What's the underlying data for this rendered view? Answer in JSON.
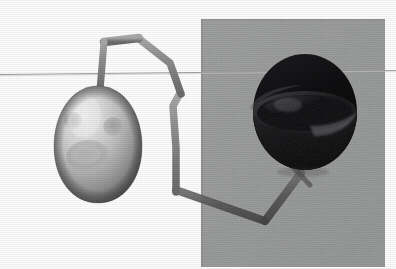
{
  "scene": {
    "title": "3D rendered scene: egg object and dark bowl linked by jointed arm",
    "width": 396,
    "height": 269,
    "background_color": "#fefefe"
  },
  "backdrop_panel": {
    "name": "gray-backdrop-panel",
    "color": "#999a9a",
    "edge_color": "#8e8f8f",
    "x": 201,
    "y": 19,
    "width": 184,
    "height": 248
  },
  "horizon_line": {
    "name": "horizon-line",
    "color": "#9b9b9b",
    "x1": 0,
    "y1": 74,
    "x2": 396,
    "y2": 70,
    "thickness": 1
  },
  "egg_object": {
    "name": "egg-object",
    "center_x": 98,
    "center_y": 145,
    "radius_x": 44,
    "radius_y": 58,
    "base_color": "#b9b9b9",
    "highlight_color": "#ececec",
    "shadow_color": "#6e6e6e",
    "spots": [
      {
        "name": "egg-spot-upper-left",
        "cx": 73,
        "cy": 121,
        "rx": 9,
        "ry": 9,
        "color": "#9a9a9a"
      },
      {
        "name": "egg-spot-upper-right",
        "cx": 113,
        "cy": 127,
        "rx": 10,
        "ry": 10,
        "color": "#969696"
      },
      {
        "name": "egg-spot-large-lower",
        "cx": 88,
        "cy": 156,
        "rx": 22,
        "ry": 16,
        "color": "#a5a5a5"
      }
    ]
  },
  "bowl_object": {
    "name": "bowl-object",
    "center_x": 305,
    "center_y": 128,
    "radius_x": 52,
    "radius_y": 42,
    "body_color": "#141414",
    "interior_color": "#0c0c0c",
    "rim_highlight_color": "#56565a",
    "inner_sheen_color": "#3e3e42"
  },
  "arm_linkage": {
    "name": "arm-linkage",
    "color": "#8a8a8a",
    "dark_color": "#5b5b5b",
    "thickness": 7,
    "joints": [
      {
        "name": "joint-egg-apex",
        "x": 100,
        "y": 88
      },
      {
        "name": "joint-upper-left-elbow",
        "x": 104,
        "y": 41
      },
      {
        "name": "joint-upper-apex",
        "x": 138,
        "y": 38
      },
      {
        "name": "joint-upper-right-elbow",
        "x": 170,
        "y": 62
      },
      {
        "name": "joint-mid-upper",
        "x": 180,
        "y": 93
      },
      {
        "name": "joint-mid-kink",
        "x": 173,
        "y": 105
      },
      {
        "name": "joint-mid-lower",
        "x": 176,
        "y": 148
      },
      {
        "name": "joint-lower-elbow",
        "x": 176,
        "y": 190
      },
      {
        "name": "joint-bottom-vertex",
        "x": 265,
        "y": 220
      },
      {
        "name": "joint-bowl-base",
        "x": 300,
        "y": 172
      }
    ]
  },
  "labels": {
    "egg": "egg",
    "bowl": "bowl",
    "arm": "articulated arm",
    "panel": "gray panel"
  }
}
